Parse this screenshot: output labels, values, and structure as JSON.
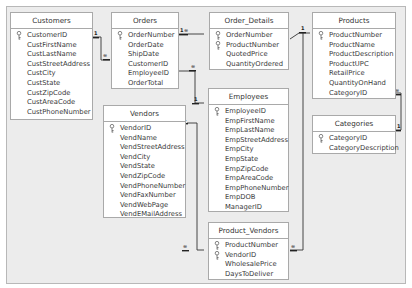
{
  "tables": {
    "customers": {
      "title": "Customers",
      "fields": [
        {
          "name": "CustomerID",
          "key": true
        },
        {
          "name": "CustFirstName",
          "key": false
        },
        {
          "name": "CustLastName",
          "key": false
        },
        {
          "name": "CustStreetAddress",
          "key": false
        },
        {
          "name": "CustCity",
          "key": false
        },
        {
          "name": "CustState",
          "key": false
        },
        {
          "name": "CustZipCode",
          "key": false
        },
        {
          "name": "CustAreaCode",
          "key": false
        },
        {
          "name": "CustPhoneNumber",
          "key": false
        }
      ]
    },
    "orders": {
      "title": "Orders",
      "fields": [
        {
          "name": "OrderNumber",
          "key": true
        },
        {
          "name": "OrderDate",
          "key": false
        },
        {
          "name": "ShipDate",
          "key": false
        },
        {
          "name": "CustomerID",
          "key": false
        },
        {
          "name": "EmployeeID",
          "key": false
        },
        {
          "name": "OrderTotal",
          "key": false
        }
      ]
    },
    "order_details": {
      "title": "Order_Details",
      "fields": [
        {
          "name": "OrderNumber",
          "key": true
        },
        {
          "name": "ProductNumber",
          "key": true
        },
        {
          "name": "QuotedPrice",
          "key": false
        },
        {
          "name": "QuantityOrdered",
          "key": false
        }
      ]
    },
    "products": {
      "title": "Products",
      "fields": [
        {
          "name": "ProductNumber",
          "key": true
        },
        {
          "name": "ProductName",
          "key": false
        },
        {
          "name": "ProductDescription",
          "key": false
        },
        {
          "name": "ProductUPC",
          "key": false
        },
        {
          "name": "RetailPrice",
          "key": false
        },
        {
          "name": "QuantityOnHand",
          "key": false
        },
        {
          "name": "CategoryID",
          "key": false
        }
      ]
    },
    "categories": {
      "title": "Categories",
      "fields": [
        {
          "name": "CategoryID",
          "key": true
        },
        {
          "name": "CategoryDescription",
          "key": false
        }
      ]
    },
    "vendors": {
      "title": "Vendors",
      "fields": [
        {
          "name": "VendorID",
          "key": true
        },
        {
          "name": "VendName",
          "key": false
        },
        {
          "name": "VendStreetAddress",
          "key": false
        },
        {
          "name": "VendCity",
          "key": false
        },
        {
          "name": "VendState",
          "key": false
        },
        {
          "name": "VendZipCode",
          "key": false
        },
        {
          "name": "VendPhoneNumber",
          "key": false
        },
        {
          "name": "VendFaxNumber",
          "key": false
        },
        {
          "name": "VendWebPage",
          "key": false
        },
        {
          "name": "VendEMailAddress",
          "key": false
        }
      ]
    },
    "employees": {
      "title": "Employees",
      "fields": [
        {
          "name": "EmployeeID",
          "key": true
        },
        {
          "name": "EmpFirstName",
          "key": false
        },
        {
          "name": "EmpLastName",
          "key": false
        },
        {
          "name": "EmpStreetAddress",
          "key": false
        },
        {
          "name": "EmpCity",
          "key": false
        },
        {
          "name": "EmpState",
          "key": false
        },
        {
          "name": "EmpZipCode",
          "key": false
        },
        {
          "name": "EmpAreaCode",
          "key": false
        },
        {
          "name": "EmpPhoneNumber",
          "key": false
        },
        {
          "name": "EmpDOB",
          "key": false
        },
        {
          "name": "ManagerID",
          "key": false
        }
      ]
    },
    "product_vendors": {
      "title": "Product_Vendors",
      "fields": [
        {
          "name": "ProductNumber",
          "key": true
        },
        {
          "name": "VendorID",
          "key": true
        },
        {
          "name": "WholesalePrice",
          "key": false
        },
        {
          "name": "DaysToDeliver",
          "key": false
        }
      ]
    }
  },
  "relationships": [
    {
      "from": "Customers.CustomerID",
      "to": "Orders.CustomerID",
      "from_card": "1",
      "to_card": "∞"
    },
    {
      "from": "Orders.OrderNumber",
      "to": "Order_Details.OrderNumber",
      "from_card": "1",
      "to_card": "∞"
    },
    {
      "from": "Employees.EmployeeID",
      "to": "Orders.EmployeeID",
      "from_card": "1",
      "to_card": "∞"
    },
    {
      "from": "Products.ProductNumber",
      "to": "Order_Details.ProductNumber",
      "from_card": "1",
      "to_card": "∞"
    },
    {
      "from": "Categories.CategoryID",
      "to": "Products.CategoryID",
      "from_card": "1",
      "to_card": "∞"
    },
    {
      "from": "Vendors.VendorID",
      "to": "Product_Vendors.VendorID",
      "from_card": "1",
      "to_card": "∞"
    },
    {
      "from": "Products.ProductNumber",
      "to": "Product_Vendors.ProductNumber",
      "from_card": "1",
      "to_card": "∞"
    }
  ],
  "cardinality": {
    "one": "1",
    "many": "∞"
  }
}
